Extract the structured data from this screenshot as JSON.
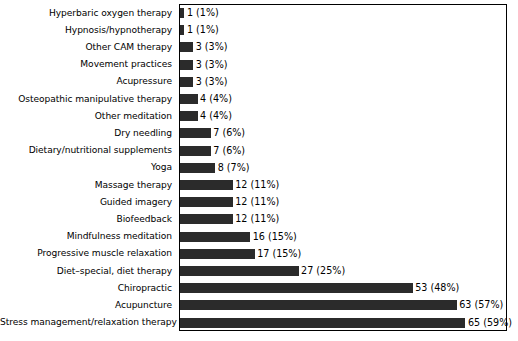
{
  "chart_data": {
    "type": "bar",
    "orientation": "horizontal",
    "title": "",
    "subtitle": "",
    "xlabel": "",
    "ylabel": "",
    "xlim": [
      0,
      74
    ],
    "grid": false,
    "legend": null,
    "bar_color": "#2b2b2b",
    "frame_color": "#000000",
    "background": "#ffffff",
    "categories": [
      "Hyperbaric oxygen therapy",
      "Hypnosis/hypnotherapy",
      "Other CAM therapy",
      "Movement practices",
      "Acupressure",
      "Osteopathic manipulative therapy",
      "Other meditation",
      "Dry needling",
      "Dietary/nutritional supplements",
      "Yoga",
      "Massage therapy",
      "Guided imagery",
      "Biofeedback",
      "Mindfulness meditation",
      "Progressive muscle relaxation",
      "Diet–special, diet therapy",
      "Chiropractic",
      "Acupuncture",
      "Stress management/relaxation therapy"
    ],
    "values": [
      1,
      1,
      3,
      3,
      3,
      4,
      4,
      7,
      7,
      8,
      12,
      12,
      12,
      16,
      17,
      27,
      53,
      63,
      65
    ],
    "percents": [
      1,
      1,
      3,
      3,
      3,
      4,
      4,
      6,
      6,
      7,
      11,
      11,
      11,
      15,
      15,
      25,
      48,
      57,
      59
    ],
    "data_labels": [
      "1 (1%)",
      "1 (1%)",
      "3 (3%)",
      "3 (3%)",
      "3 (3%)",
      "4 (4%)",
      "4 (4%)",
      "7 (6%)",
      "7 (6%)",
      "8 (7%)",
      "12 (11%)",
      "12 (11%)",
      "12 (11%)",
      "16 (15%)",
      "17 (15%)",
      "27 (25%)",
      "53 (48%)",
      "63 (57%)",
      "65 (59%)"
    ]
  }
}
